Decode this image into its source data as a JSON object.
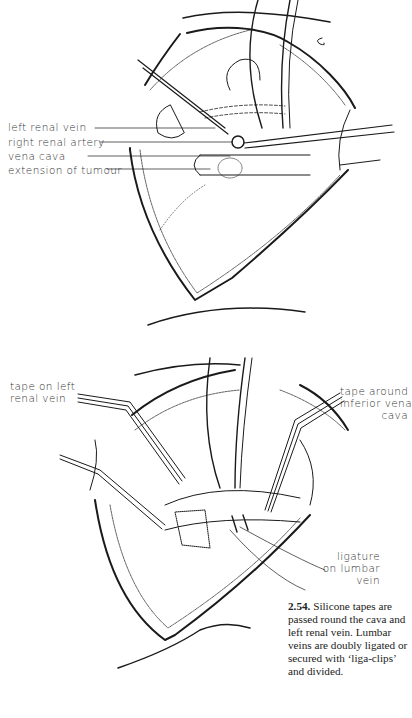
{
  "figure": {
    "number": "2.54.",
    "caption": "Silicone tapes are passed round the cava and left renal vein. Lumbar veins are doubly ligated or secured with ‘liga-clips’ and divided."
  },
  "top_illustration": {
    "labels": [
      "left renal vein",
      "right renal artery",
      "vena cava",
      "extension of tumour"
    ]
  },
  "bottom_illustration": {
    "labels": {
      "tape_left_line1": "tape on left",
      "tape_left_line2": "renal vein",
      "tape_ivc_line1": "tape around",
      "tape_ivc_line2": "inferior vena",
      "tape_ivc_line3": "cava",
      "ligature_line1": "ligature",
      "ligature_line2": "on lumbar",
      "ligature_line3": "vein"
    }
  },
  "colors": {
    "ink": "#1a1a1a",
    "paper": "#ffffff"
  }
}
